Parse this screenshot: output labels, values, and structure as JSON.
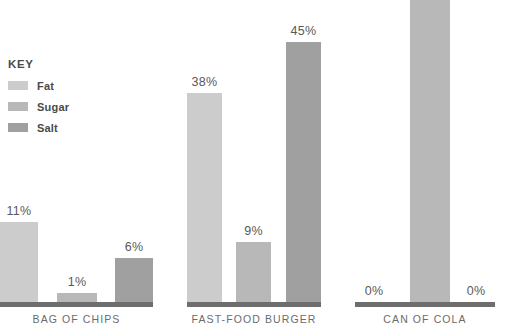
{
  "legend": {
    "title": "KEY",
    "items": [
      {
        "label": "Fat",
        "color": "#cccccc"
      },
      {
        "label": "Sugar",
        "color": "#b8b8b8"
      },
      {
        "label": "Salt",
        "color": "#a0a0a0"
      }
    ]
  },
  "axis": {
    "baseline_color": "#6e6e6e"
  },
  "chart_data": {
    "type": "bar",
    "title": "",
    "xlabel": "",
    "ylabel": "",
    "unit": "%",
    "grid": false,
    "legend_position": "left",
    "categories": [
      "BAG OF CHIPS",
      "FAST-FOOD BURGER",
      "CAN OF COLA"
    ],
    "series": [
      {
        "name": "Fat",
        "color": "#cccccc",
        "values": [
          11,
          38,
          0
        ],
        "labels": [
          "11%",
          "38%",
          "0%"
        ]
      },
      {
        "name": "Sugar",
        "color": "#b8b8b8",
        "values": [
          1,
          9,
          100
        ],
        "labels": [
          "1%",
          "9%",
          ""
        ]
      },
      {
        "name": "Salt",
        "color": "#a0a0a0",
        "values": [
          6,
          45,
          0
        ],
        "labels": [
          "6%",
          "45%",
          "0%"
        ]
      }
    ]
  },
  "groups": [
    {
      "id": "bag-of-chips",
      "label": "BAG OF CHIPS",
      "left": 0,
      "width": 153,
      "baseline_left": 0,
      "baseline_width": 153,
      "bars": [
        {
          "series": "Fat",
          "label": "11%",
          "left": 0,
          "width": 38,
          "height": 80,
          "color": "#cccccc"
        },
        {
          "series": "Sugar",
          "label": "1%",
          "left": 57,
          "width": 40,
          "height": 9,
          "color": "#b8b8b8"
        },
        {
          "series": "Salt",
          "label": "6%",
          "left": 115,
          "width": 38,
          "height": 44,
          "color": "#a0a0a0"
        }
      ]
    },
    {
      "id": "fast-food-burger",
      "label": "FAST-FOOD BURGER",
      "left": 187,
      "width": 134,
      "baseline_left": 187,
      "baseline_width": 134,
      "bars": [
        {
          "series": "Fat",
          "label": "38%",
          "left": 0,
          "width": 35,
          "height": 209,
          "color": "#cccccc"
        },
        {
          "series": "Sugar",
          "label": "9%",
          "left": 49,
          "width": 35,
          "height": 60,
          "color": "#b8b8b8"
        },
        {
          "series": "Salt",
          "label": "45%",
          "left": 99,
          "width": 35,
          "height": 260,
          "color": "#a0a0a0"
        }
      ]
    },
    {
      "id": "can-of-cola",
      "label": "CAN OF COLA",
      "left": 355,
      "width": 140,
      "baseline_left": 355,
      "baseline_width": 140,
      "bars": [
        {
          "series": "Fat",
          "label": "0%",
          "left": 0,
          "width": 38,
          "height": 0,
          "color": "#cccccc"
        },
        {
          "series": "Sugar",
          "label": "",
          "left": 55,
          "width": 40,
          "height": 330,
          "color": "#b8b8b8"
        },
        {
          "series": "Salt",
          "label": "0%",
          "left": 102,
          "width": 38,
          "height": 0,
          "color": "#a0a0a0"
        }
      ]
    }
  ]
}
